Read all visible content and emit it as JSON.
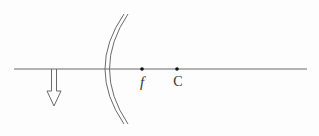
{
  "diagram": {
    "type": "concave-mirror-ray-diagram",
    "components": {
      "principal_axis": {
        "label": ""
      },
      "mirror": {
        "kind": "concave mirror",
        "label": ""
      },
      "object": {
        "kind": "arrow",
        "orientation": "down",
        "label": ""
      },
      "focal_point": {
        "label": "f"
      },
      "center_of_curvature": {
        "label": "C"
      }
    },
    "colors": {
      "line": "#6b6b6b",
      "dot": "#111111",
      "text": "#333333"
    }
  }
}
